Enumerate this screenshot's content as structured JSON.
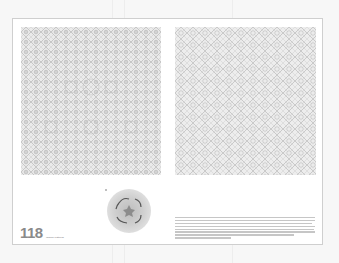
{
  "document": {
    "type": "book page spread",
    "page_number": "118",
    "page_label": "Islamic Patterns",
    "figures": [
      {
        "name": "left-geometric-pattern",
        "description": "dense interlaced star lattice pattern"
      },
      {
        "name": "right-geometric-pattern",
        "description": "dense interlaced star lattice pattern"
      },
      {
        "name": "circular-medallion",
        "description": "circular rosette medallion with star at center"
      }
    ],
    "caption": {
      "text": "Caption text (illegible at screenshot resolution)",
      "line_count": 8
    },
    "colors": {
      "page": "#ffffff",
      "background": "#f7f7f7",
      "pattern_ink": "#9a9a9a",
      "page_number": "#8a8a8a"
    }
  }
}
